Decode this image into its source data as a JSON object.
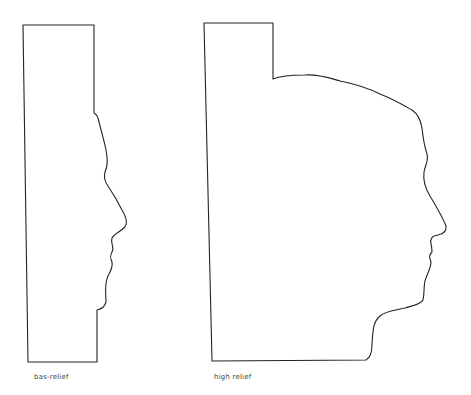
{
  "figure": {
    "panels": [
      {
        "id": "bas",
        "caption": "bas-relief"
      },
      {
        "id": "high",
        "caption": "high relief"
      }
    ],
    "stroke_color": "#222222",
    "background": "#ffffff"
  }
}
